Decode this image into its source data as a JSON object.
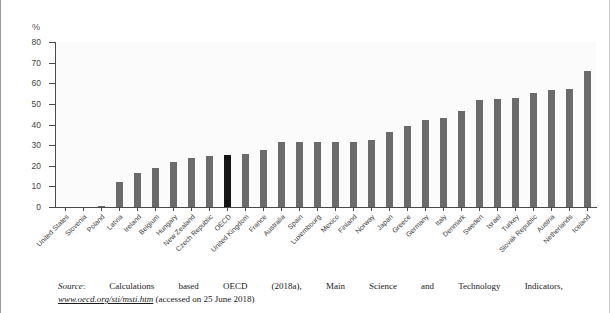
{
  "chart_data": {
    "type": "bar",
    "title": "",
    "xlabel": "",
    "ylabel": "%",
    "ylim": [
      0,
      80
    ],
    "yticks": [
      0,
      10,
      20,
      30,
      40,
      50,
      60,
      70,
      80
    ],
    "grid": false,
    "legend": "none",
    "highlight_category": "OECD",
    "highlight_color": "#141414",
    "bar_color": "#6b6b6b",
    "categories": [
      "United States",
      "Slovenia",
      "Poland",
      "Latvia",
      "Ireland",
      "Belgium",
      "Hungary",
      "New Zealand",
      "Czech Republic",
      "OECD",
      "United Kingdom",
      "France",
      "Australia",
      "Spain",
      "Luxembourg",
      "Mexico",
      "Finland",
      "Norway",
      "Japan",
      "Greece",
      "Germany",
      "Italy",
      "Denmark",
      "Sweden",
      "Israel",
      "Turkey",
      "Slovak Republic",
      "Austria",
      "Netherlands",
      "Iceland"
    ],
    "values": [
      0,
      0,
      0.5,
      12,
      16.5,
      19,
      22,
      24,
      24.5,
      25,
      25.5,
      27.5,
      31.5,
      31.5,
      31.5,
      31.5,
      31.5,
      32.5,
      36.5,
      39.5,
      42,
      43,
      46.5,
      52,
      52.5,
      53,
      55.5,
      56.5,
      57,
      66
    ]
  },
  "source_note": {
    "label": "Source",
    "colon": ":",
    "words": [
      "Calculations",
      "based",
      "OECD",
      "(2018a),",
      "Main",
      "Science",
      "and",
      "Technology",
      "Indicators,"
    ],
    "url": "www.oecd.org/sti/msti.htm",
    "access": " (accessed on 25 June 2018)"
  }
}
